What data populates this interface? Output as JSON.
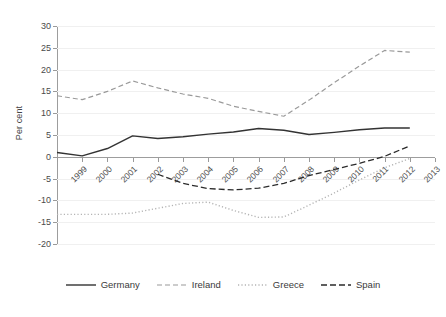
{
  "chart_data": {
    "type": "line",
    "title": "",
    "xlabel": "",
    "ylabel": "Per cent",
    "xlim": [
      1999,
      2014
    ],
    "ylim": [
      -20,
      30
    ],
    "ytick_step": 5,
    "grid": true,
    "legend_position": "bottom",
    "x": [
      1999,
      2000,
      2001,
      2002,
      2003,
      2004,
      2005,
      2006,
      2007,
      2008,
      2009,
      2010,
      2011,
      2012,
      2013,
      2014
    ],
    "xticklabels": [
      "1999",
      "2000",
      "2001",
      "2002",
      "2003",
      "2004",
      "2005",
      "2006",
      "2007",
      "2008",
      "2009",
      "2010",
      "2011",
      "2012",
      "2013",
      "2014"
    ],
    "yticklabels": [
      "30",
      "25",
      "20",
      "15",
      "10",
      "5",
      "0",
      "-5",
      "-10",
      "-15",
      "-20"
    ],
    "yticks": [
      30,
      25,
      20,
      15,
      10,
      5,
      0,
      -5,
      -10,
      -15,
      -20
    ],
    "series": [
      {
        "name": "Germany",
        "color": "#333333",
        "style": "solid",
        "dash": "none",
        "width": 1.4,
        "values": [
          1.0,
          0.2,
          1.9,
          4.8,
          4.2,
          4.6,
          5.2,
          5.7,
          6.5,
          6.1,
          5.1,
          5.6,
          6.2,
          6.6,
          6.6,
          null
        ]
      },
      {
        "name": "Ireland",
        "color": "#9a9a9a",
        "style": "dashed",
        "dash": "5,3",
        "width": 1.2,
        "values": [
          14.0,
          13.1,
          15.0,
          17.4,
          15.8,
          14.4,
          13.4,
          11.6,
          10.4,
          9.3,
          13.0,
          17.0,
          20.8,
          24.4,
          24.0,
          null
        ]
      },
      {
        "name": "Greece",
        "color": "#b4b4b4",
        "style": "dotted",
        "dash": "1.2,2.2",
        "width": 1.4,
        "values": [
          -13.2,
          -13.2,
          -13.2,
          -12.9,
          -11.8,
          -10.7,
          -10.4,
          -12.3,
          -13.9,
          -13.8,
          -11.1,
          -8.3,
          -5.3,
          -2.5,
          -0.4,
          null
        ]
      },
      {
        "name": "Spain",
        "color": "#2b2b2b",
        "style": "dashed",
        "dash": "6,3",
        "width": 1.3,
        "values": [
          null,
          null,
          null,
          null,
          -4.0,
          -6.1,
          -7.3,
          -7.6,
          -7.2,
          -6.1,
          -4.3,
          -2.9,
          -1.5,
          0.1,
          2.5,
          null
        ]
      }
    ]
  },
  "legend": {
    "items": [
      {
        "label": "Germany"
      },
      {
        "label": "Ireland"
      },
      {
        "label": "Greece"
      },
      {
        "label": "Spain"
      }
    ]
  }
}
